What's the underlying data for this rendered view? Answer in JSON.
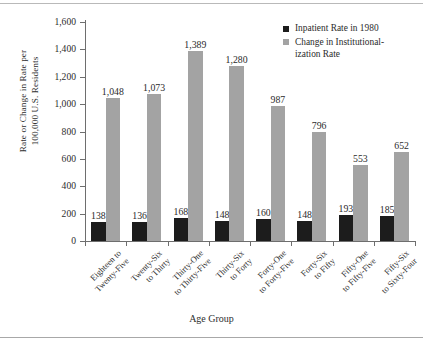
{
  "chart_data": {
    "type": "bar",
    "title": "",
    "xlabel": "Age Group",
    "ylabel": "Rate or Change in Rate per 100,000 U.S. Residents",
    "ylabel_lines": [
      "Rate or Change in Rate per",
      "100,000 U.S. Residents"
    ],
    "ylim": [
      0,
      1600
    ],
    "ytick_labels": [
      "0",
      "200",
      "400",
      "600",
      "800",
      "1,000",
      "1,200",
      "1,400",
      "1,600"
    ],
    "ytick_values": [
      0,
      200,
      400,
      600,
      800,
      1000,
      1200,
      1400,
      1600
    ],
    "grid": false,
    "legend_position": "top-right",
    "categories": [
      "Eighteen to Twenty-Five",
      "Twenty-Six to Thirty",
      "Thirty-One to Thirty-Five",
      "Thirty-Six to Forty",
      "Forty-One to Forty-Five",
      "Forty-Six to Fifty",
      "Fifty-One to Fifty-Five",
      "Fifty-Six to Sixty-Four"
    ],
    "category_lines": [
      [
        "Eighteen to",
        "Twenty-Five"
      ],
      [
        "Twenty-Six",
        "to Thirty"
      ],
      [
        "Thirty-One",
        "to Thirty-Five"
      ],
      [
        "Thirty-Six",
        "to Forty"
      ],
      [
        "Forty-One",
        "to Forty-Five"
      ],
      [
        "Forty-Six",
        "to Fifty"
      ],
      [
        "Fifty-One",
        "to Fifty-Five"
      ],
      [
        "Fifty-Six",
        "to Sixty-Four"
      ]
    ],
    "series": [
      {
        "name": "Inpatient Rate in 1980",
        "color": "#1c1c1c",
        "values": [
          138,
          136,
          168,
          148,
          160,
          148,
          193,
          185
        ],
        "labels": [
          "138",
          "136",
          "168",
          "148",
          "160",
          "148",
          "193",
          "185"
        ]
      },
      {
        "name": "Change in Institutionalization Rate",
        "color": "#a3a3a3",
        "values": [
          1048,
          1073,
          1389,
          1280,
          987,
          796,
          553,
          652
        ],
        "labels": [
          "1,048",
          "1,073",
          "1,389",
          "1,280",
          "987",
          "796",
          "553",
          "652"
        ]
      }
    ]
  },
  "legend": {
    "entries": [
      {
        "label": "Inpatient Rate in 1980",
        "lines": [
          "Inpatient Rate in 1980"
        ],
        "color": "#1c1c1c"
      },
      {
        "label": "Change in Institutionalization Rate",
        "lines": [
          "Change in Institutional-",
          "ization Rate"
        ],
        "color": "#a3a3a3"
      }
    ]
  }
}
